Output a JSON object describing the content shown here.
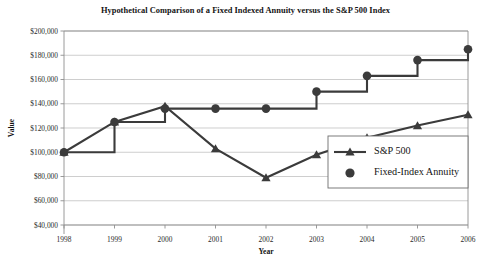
{
  "chart_data": {
    "type": "line",
    "title": "Hypothetical Comparison of a Fixed Indexed Annuity versus the S&P 500 Index",
    "xlabel": "Year",
    "ylabel": "Value",
    "categories": [
      "1998",
      "1999",
      "2000",
      "2001",
      "2002",
      "2003",
      "2004",
      "2005",
      "2006"
    ],
    "x": [
      1998,
      1999,
      2000,
      2001,
      2002,
      2003,
      2004,
      2005,
      2006
    ],
    "ylim": [
      40000,
      200000
    ],
    "ytick_values": [
      40000,
      60000,
      80000,
      100000,
      120000,
      140000,
      160000,
      180000,
      200000
    ],
    "ytick_labels": [
      "$40,000",
      "$60,000",
      "$80,000",
      "$100,000",
      "$120,000",
      "$140,000",
      "$160,000",
      "$180,000",
      "$200,000"
    ],
    "grid": true,
    "legend_position": "center-right",
    "series": [
      {
        "name": "S&P 500",
        "marker": "triangle",
        "style": "straight",
        "color": "#3b3b3b",
        "values": [
          100000,
          125000,
          138000,
          103000,
          79000,
          98000,
          112000,
          122000,
          131000
        ]
      },
      {
        "name": "Fixed-Index Annuity",
        "marker": "circle",
        "style": "step",
        "color": "#3b3b3b",
        "values": [
          100000,
          125000,
          136000,
          136000,
          136000,
          150000,
          163000,
          176000,
          185000
        ]
      }
    ]
  },
  "legend": {
    "items": [
      {
        "label": "S&P 500",
        "marker": "triangle-with-line"
      },
      {
        "label": "Fixed-Index Annuity",
        "marker": "circle"
      }
    ]
  },
  "colors": {
    "series": "#3b3b3b",
    "grid": "#b9b9b9",
    "axis": "#8f8f8f",
    "text": "#141414",
    "background": "#ffffff"
  }
}
